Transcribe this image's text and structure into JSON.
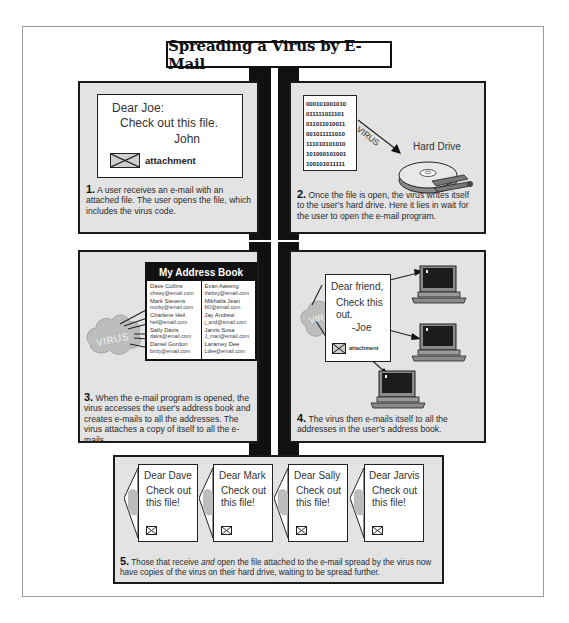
{
  "title": "Spreading a Virus by E-Mail",
  "colors": {
    "panel_bg": "#e3e3e3",
    "border": "#1a1a1a",
    "spine": "#111111",
    "cloud": "#bdbdbd",
    "screen": "#1c1c1c",
    "computer_body": "#8a8a8a"
  },
  "panels": [
    {
      "step": "1.",
      "caption": "A user receives an e-mail with an attached file. The user opens the file, which includes the virus code.",
      "email": {
        "greeting": "Dear Joe:",
        "body": "Check out this file.",
        "signature": "John",
        "attachment_label": "attachment",
        "attachment_icon": "envelope-icon"
      }
    },
    {
      "step": "2.",
      "caption": "Once the file is open, the virus writes itself to the user's hard drive. Here it lies in wait for the user to open the e-mail program.",
      "binary_lines": [
        "000101001010",
        "011111011101",
        "011011010011",
        "001011111010",
        "111010101010",
        "101000101001",
        "100101011111"
      ],
      "arrow_label": "VIRUS",
      "drive_label": "Hard Drive",
      "drive_icon": "hard-drive-icon"
    },
    {
      "step": "3.",
      "caption": "When the e-mail program is opened, the virus accesses the user's address book and creates e-mails to all the addresses. The virus attaches a copy of itself to all the e-mails.",
      "cloud_label": "VIRUS",
      "address_book": {
        "title": "My Address Book",
        "left_column": [
          {
            "name": "Dave Cullins",
            "email": "chewy@email.com"
          },
          {
            "name": "Mark Stevens",
            "email": "morky@email.com"
          },
          {
            "name": "Charlene Heil",
            "email": "heil@email.com"
          },
          {
            "name": "Sally Davis",
            "email": "davis@email.com"
          },
          {
            "name": "Daniel Gordon",
            "email": "birdy@email.com"
          }
        ],
        "right_column": [
          {
            "name": "Evan Aaseng",
            "email": "theboy@email.com"
          },
          {
            "name": "Mikhaila Jean",
            "email": "MJ@email.com"
          },
          {
            "name": "Jay Andrew",
            "email": "j_and@email.com"
          },
          {
            "name": "Jarvis Sosa",
            "email": "J_man@email.com"
          },
          {
            "name": "Laramey Dee",
            "email": "Ldee@email.com"
          }
        ]
      }
    },
    {
      "step": "4.",
      "caption": "The virus then e-mails itself to all the addresses in the user's address book.",
      "cloud_label": "VIR",
      "email": {
        "greeting": "Dear friend,",
        "body_line1": "Check this",
        "body_line2": "out.",
        "signature": "-Joe",
        "attachment_label": "attachment"
      },
      "computers": 3
    },
    {
      "step": "5.",
      "caption_pre": "Those that receive ",
      "caption_em": "and",
      "caption_post": " open the file attached to the e-mail spread by the virus now have copies of the virus on their hard drive, waiting to be spread further.",
      "letters": [
        {
          "greeting": "Dear Dave",
          "line1": "Check out",
          "line2": "this file!"
        },
        {
          "greeting": "Dear Mark",
          "line1": "Check out",
          "line2": "this file!"
        },
        {
          "greeting": "Dear Sally",
          "line1": "Check out",
          "line2": "this file!"
        },
        {
          "greeting": "Dear Jarvis",
          "line1": "Check out",
          "line2": "this file!"
        }
      ]
    }
  ]
}
